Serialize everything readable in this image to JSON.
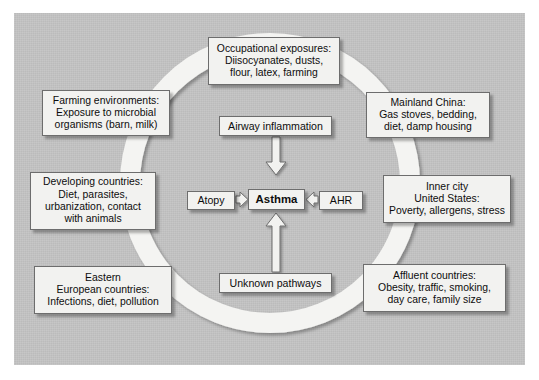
{
  "figure": {
    "background_color": "#ffffff",
    "panel_color": "#c3c3c3",
    "box_fill": "#f2f2f0",
    "box_border": "#6d6d6d",
    "ring_color": "#f4f4f2"
  },
  "center": {
    "core": "Asthma",
    "airway": "Airway inflammation",
    "atopy": "Atopy",
    "ahr": "AHR",
    "unknown": "Unknown pathways"
  },
  "outer_boxes": [
    {
      "id": "occupational",
      "lines": [
        "Occupational exposures:",
        "Diisocyanates, dusts,",
        "flour, latex, farming"
      ]
    },
    {
      "id": "farming",
      "lines": [
        "Farming environments:",
        "Exposure to microbial",
        "organisms (barn, milk)"
      ]
    },
    {
      "id": "china",
      "lines": [
        "Mainland China:",
        "Gas stoves, bedding,",
        "diet, damp housing"
      ]
    },
    {
      "id": "developing",
      "lines": [
        "Developing countries:",
        "Diet, parasites,",
        "urbanization, contact",
        "with animals"
      ]
    },
    {
      "id": "innercity",
      "lines": [
        "Inner city",
        "United States:",
        "Poverty, allergens, stress"
      ]
    },
    {
      "id": "eastern",
      "lines": [
        "Eastern",
        "European countries:",
        "Infections, diet, pollution"
      ]
    },
    {
      "id": "affluent",
      "lines": [
        "Affluent countries:",
        "Obesity, traffic, smoking,",
        "day care, family size"
      ]
    }
  ]
}
